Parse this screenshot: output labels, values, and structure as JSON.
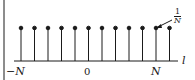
{
  "figure": {
    "axis_label": "l",
    "tick_labels": {
      "left": "−N",
      "center": "0",
      "right": "N"
    },
    "annotation": {
      "numerator": "1",
      "denominator": "N"
    },
    "colors": {
      "ink": "#1a1a1a",
      "background": "#ffffff"
    }
  },
  "chart_data": {
    "type": "stem",
    "title": "",
    "xlabel": "l",
    "ylabel": "",
    "x_ticks": [
      "−N",
      "0",
      "N"
    ],
    "stem_count": 12,
    "stem_value": "1/N",
    "annotation": "1/N"
  }
}
